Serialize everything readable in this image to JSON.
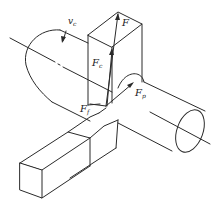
{
  "figure": {
    "labels": {
      "cutting_speed": "v",
      "cutting_speed_sub": "c",
      "resultant_force": "F",
      "main_force": "F",
      "main_force_sub": "c",
      "feed_force": "F",
      "feed_force_sub": "f",
      "radial_force": "F",
      "radial_force_sub": "p"
    },
    "colors": {
      "line": "#2a2a2a",
      "background": "#ffffff"
    }
  }
}
